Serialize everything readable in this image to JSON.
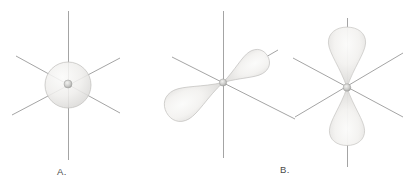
{
  "diagram": {
    "labels": {
      "panel_a": "A.",
      "panel_b": "B."
    },
    "panels": [
      {
        "label": "A.",
        "orbitals": [
          "s-orbital-sphere-with-nucleus"
        ]
      },
      {
        "label": "B.",
        "orbitals": [
          "p-orbital-diagonal-lobes-with-nucleus",
          "p-orbital-vertical-lobes-with-nucleus"
        ]
      }
    ],
    "colors": {
      "background": "#ffffff",
      "axis_line": "#9a9a9a",
      "orbital_highlight": "#fbfbfa",
      "orbital_fill": "#efeeec",
      "orbital_shade": "#d8d7d5",
      "orbital_stroke": "#c5c4c2",
      "nucleus_center": "#f2f2f0",
      "nucleus_rim": "#a5a5a3",
      "label_text": "#4b4b4b"
    }
  }
}
